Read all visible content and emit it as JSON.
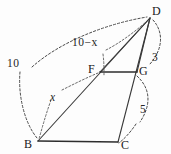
{
  "figure": {
    "vertices": [
      {
        "id": "D",
        "label": "D",
        "x": 150,
        "y": 18
      },
      {
        "id": "F",
        "label": "F",
        "x": 100,
        "y": 72
      },
      {
        "id": "G",
        "label": "G",
        "x": 137,
        "y": 72
      },
      {
        "id": "B",
        "label": "B",
        "x": 38,
        "y": 141
      },
      {
        "id": "C",
        "label": "C",
        "x": 118,
        "y": 142
      }
    ],
    "edges": [
      {
        "id": "BD",
        "from": "B",
        "to": "D",
        "style": "solid"
      },
      {
        "id": "FD",
        "from": "F",
        "to": "D",
        "style": "solid"
      },
      {
        "id": "GD",
        "from": "G",
        "to": "D",
        "style": "solid"
      },
      {
        "id": "CD",
        "from": "C",
        "to": "D",
        "style": "solid"
      },
      {
        "id": "FG",
        "from": "F",
        "to": "G",
        "style": "solid"
      },
      {
        "id": "BC",
        "from": "B",
        "to": "C",
        "style": "solid"
      }
    ],
    "measurements": [
      {
        "id": "len-10",
        "label": "10",
        "kind": "number",
        "x": 7,
        "y": 58,
        "spans": "B to D"
      },
      {
        "id": "len-10-x",
        "label": "10−x",
        "kind": "mixed",
        "x": 72,
        "y": 37,
        "spans": "F to D"
      },
      {
        "id": "len-x",
        "label": "x",
        "kind": "var",
        "x": 50,
        "y": 92,
        "spans": "B to F"
      },
      {
        "id": "len-3",
        "label": "3",
        "kind": "number",
        "x": 152,
        "y": 52,
        "spans": "D to G"
      },
      {
        "id": "len-5",
        "label": "5",
        "kind": "number",
        "x": 140,
        "y": 104,
        "spans": "G to C"
      }
    ],
    "annotation_arcs": [
      {
        "id": "arc-10",
        "for": "len-10",
        "note": "long dashed arc sweeping from near label 10 up to vertex D"
      },
      {
        "id": "arc-10b",
        "for": "len-10",
        "note": "short dashed arc from below label 10 down to vertex B"
      },
      {
        "id": "arc-10-x",
        "for": "len-10-x",
        "note": "dashed arc from label 10-x to segment F-D"
      },
      {
        "id": "arc-x",
        "for": "len-x",
        "note": "dashed arc from label x down to vertex B and up toward F"
      },
      {
        "id": "arc-3",
        "for": "len-3",
        "note": "dashed arc from vertex D curving down past label 3 to vertex G"
      },
      {
        "id": "arc-5",
        "for": "len-5",
        "note": "dashed arc from vertex G curving down past label 5 to vertex C"
      }
    ],
    "colors": {
      "stroke": "#3a3a3a",
      "dash": "#4a4a4a",
      "text": "#202020",
      "background": "#fdfdfd"
    }
  }
}
